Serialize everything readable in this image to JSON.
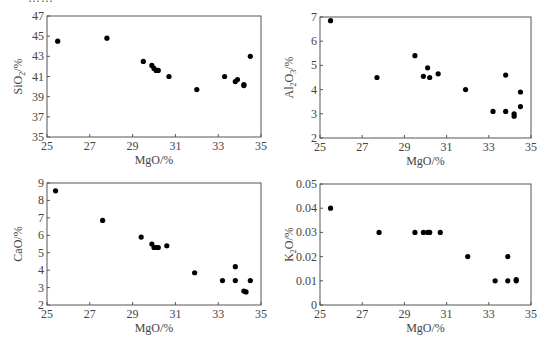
{
  "figure": {
    "top_cropped_caption": "……"
  },
  "chart_data": [
    {
      "id": "sio2",
      "type": "scatter",
      "title": "",
      "xlabel": "MgO/%",
      "ylabel": "SiO2/%",
      "ylabel_main": "SiO",
      "ylabel_sub": "2",
      "ylabel_tail": "/%",
      "xlim": [
        25,
        35
      ],
      "ylim": [
        35,
        47
      ],
      "xticks": [
        25,
        27,
        29,
        31,
        33,
        35
      ],
      "yticks": [
        35,
        37,
        39,
        41,
        43,
        45,
        47
      ],
      "grid": false,
      "legend": null,
      "x": [
        25.5,
        27.8,
        29.5,
        29.9,
        30.0,
        30.1,
        30.2,
        30.7,
        32.0,
        33.3,
        33.8,
        33.9,
        34.2,
        34.2,
        34.5
      ],
      "y": [
        44.5,
        44.8,
        42.5,
        42.1,
        41.8,
        41.6,
        41.6,
        41.0,
        39.7,
        41.0,
        40.5,
        40.7,
        40.1,
        40.2,
        43.0
      ],
      "frame": {
        "left": 47,
        "top": 16,
        "right": 261,
        "bottom": 137
      }
    },
    {
      "id": "al2o3",
      "type": "scatter",
      "title": "",
      "xlabel": "MgO/%",
      "ylabel": "Al2O3/%",
      "ylabel_main": "Al",
      "ylabel_sub": "2",
      "ylabel_mid": "O",
      "ylabel_sub2": "3",
      "ylabel_tail": "/%",
      "xlim": [
        25,
        35
      ],
      "ylim": [
        2,
        7
      ],
      "xticks": [
        25,
        27,
        29,
        31,
        33,
        35
      ],
      "yticks": [
        2,
        3,
        4,
        5,
        6,
        7
      ],
      "grid": false,
      "legend": null,
      "x": [
        25.5,
        27.7,
        29.5,
        29.9,
        30.1,
        30.2,
        30.6,
        31.9,
        33.2,
        33.8,
        33.8,
        34.2,
        34.2,
        34.5,
        34.5
      ],
      "y": [
        6.85,
        4.5,
        5.4,
        4.55,
        4.9,
        4.5,
        4.65,
        4.0,
        3.1,
        4.6,
        3.1,
        3.0,
        2.9,
        3.3,
        3.9
      ],
      "frame": {
        "left": 320,
        "top": 17,
        "right": 531,
        "bottom": 138
      }
    },
    {
      "id": "cao",
      "type": "scatter",
      "title": "",
      "xlabel": "MgO/%",
      "ylabel": "CaO/%",
      "ylabel_main": "CaO",
      "ylabel_tail": "/%",
      "xlim": [
        25,
        35
      ],
      "ylim": [
        2,
        9
      ],
      "xticks": [
        25,
        27,
        29,
        31,
        33,
        35
      ],
      "yticks": [
        2,
        3,
        4,
        5,
        6,
        7,
        8,
        9
      ],
      "grid": false,
      "legend": null,
      "x": [
        25.4,
        27.6,
        29.4,
        29.9,
        30.0,
        30.1,
        30.2,
        30.6,
        31.9,
        33.2,
        33.8,
        33.8,
        34.2,
        34.3,
        34.5
      ],
      "y": [
        8.55,
        6.85,
        5.9,
        5.5,
        5.3,
        5.3,
        5.3,
        5.4,
        3.85,
        3.4,
        4.2,
        3.4,
        2.8,
        2.75,
        3.4
      ],
      "frame": {
        "left": 47,
        "top": 183,
        "right": 261,
        "bottom": 305
      }
    },
    {
      "id": "k2o",
      "type": "scatter",
      "title": "",
      "xlabel": "MgO/%",
      "ylabel": "K2O/%",
      "ylabel_main": "K",
      "ylabel_sub": "2",
      "ylabel_mid": "O",
      "ylabel_tail": "/%",
      "xlim": [
        25,
        35
      ],
      "ylim": [
        0,
        0.05
      ],
      "xticks": [
        25,
        27,
        29,
        31,
        33,
        35
      ],
      "yticks": [
        0,
        0.01,
        0.02,
        0.03,
        0.04,
        0.05
      ],
      "ytick_labels": [
        "0",
        "0.01",
        "0.02",
        "0.03",
        "0.04",
        "0.05"
      ],
      "grid": false,
      "legend": null,
      "x": [
        25.5,
        27.8,
        29.5,
        29.9,
        30.1,
        30.2,
        30.7,
        32.0,
        33.3,
        33.9,
        33.9,
        34.3,
        34.3
      ],
      "y": [
        0.04,
        0.03,
        0.03,
        0.03,
        0.03,
        0.03,
        0.03,
        0.02,
        0.01,
        0.02,
        0.01,
        0.01,
        0.0105
      ],
      "frame": {
        "left": 320,
        "top": 184,
        "right": 531,
        "bottom": 305
      }
    }
  ],
  "style": {
    "axis_color": "#555555",
    "point_color": "#000000",
    "text_color": "#444444"
  }
}
